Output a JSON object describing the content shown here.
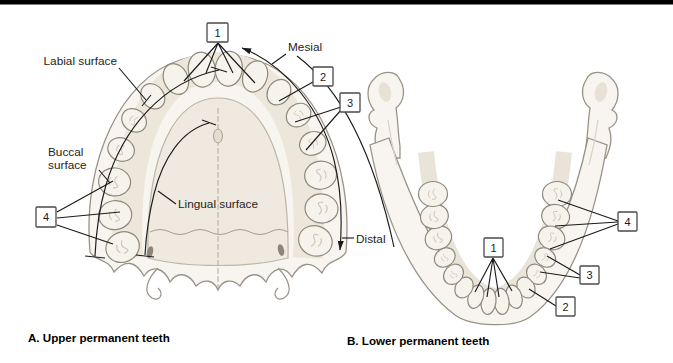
{
  "colors": {
    "top_bar": "#000000",
    "background": "#ffffff",
    "annotation_line": "#1b1b1b",
    "bone_fill": "#f8f5f0",
    "bone_outline": "#9a9287",
    "tooth_fill": "#f6f3ec",
    "marker_box_border": "#4a4a4a"
  },
  "panel_a": {
    "caption": "A. Upper permanent teeth",
    "labels": {
      "labial": "Labial surface",
      "buccal_line1": "Buccal",
      "buccal_line2": "surface",
      "lingual": "Lingual surface",
      "mesial": "Mesial",
      "distal": "Distal"
    },
    "markers": {
      "m1": "1",
      "m2": "2",
      "m3": "3",
      "m4": "4"
    }
  },
  "panel_b": {
    "caption": "B. Lower permanent teeth",
    "markers": {
      "m1": "1",
      "m2": "2",
      "m3": "3",
      "m4": "4"
    }
  }
}
